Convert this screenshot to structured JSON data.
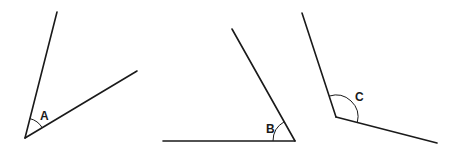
{
  "diagram": {
    "type": "angles",
    "angles": [
      {
        "label": "A",
        "kind": "acute",
        "vertex": [
          25,
          138
        ],
        "ray1_end": [
          57,
          12
        ],
        "ray2_end": [
          137,
          71
        ],
        "arc_radius": 20,
        "label_pos": [
          40,
          120
        ]
      },
      {
        "label": "B",
        "kind": "acute",
        "vertex": [
          295,
          141
        ],
        "ray1_end": [
          232,
          29
        ],
        "ray2_end": [
          163,
          141
        ],
        "arc_radius": 22,
        "label_pos": [
          266,
          133
        ]
      },
      {
        "label": "C",
        "kind": "obtuse",
        "vertex": [
          336,
          117
        ],
        "ray1_end": [
          302,
          13
        ],
        "ray2_end": [
          437,
          143
        ],
        "arc_radius": 22,
        "label_pos": [
          354,
          100
        ]
      }
    ],
    "colors": {
      "line": "#1a1a1a",
      "background": "#ffffff"
    }
  }
}
